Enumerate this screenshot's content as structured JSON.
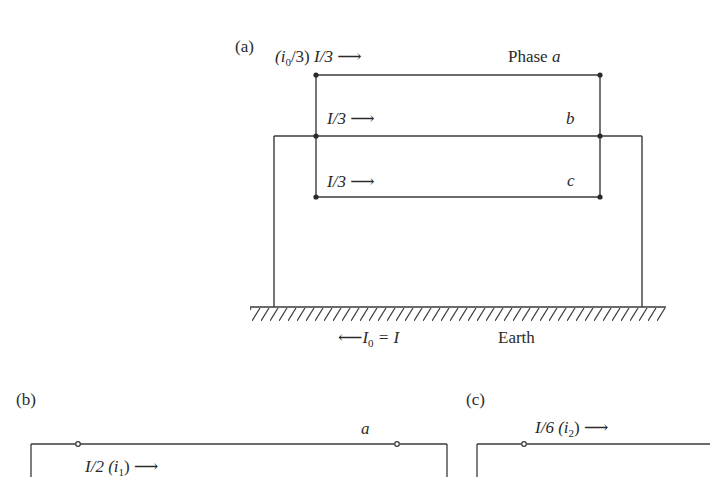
{
  "panel_a": {
    "label": "(a)",
    "current_a_prefix": "(i",
    "current_a_sub": "0",
    "current_a_suffix": "/3) ",
    "current_a_value": "I/3",
    "current_b_value": "I/3",
    "current_c_value": "I/3",
    "arrow_right": "⟶",
    "arrow_left": "⟵",
    "phase_label": "Phase ",
    "phase_a": "a",
    "phase_b": "b",
    "phase_c": "c",
    "earth_current_I": "I",
    "earth_current_sub": "0",
    "earth_current_eq": " = I",
    "earth_label": "Earth"
  },
  "panel_b": {
    "label": "(b)",
    "phase_a": "a",
    "current_value": "I/2",
    "current_sym_prefix": " (i",
    "current_sym_sub": "1",
    "current_sym_suffix": ")"
  },
  "panel_c": {
    "label": "(c)",
    "current_value": "I/6",
    "current_sym_prefix": " (i",
    "current_sym_sub": "2",
    "current_sym_suffix": ")"
  },
  "colors": {
    "line": "#3a3a3a",
    "text": "#2a2a2a"
  }
}
